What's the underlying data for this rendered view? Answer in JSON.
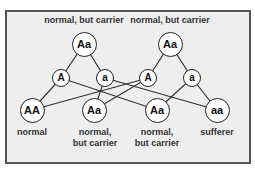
{
  "diagram": {
    "type": "genetic-cross",
    "parents": [
      {
        "id": "p1",
        "genotype": "Aa",
        "label": "normal, but carrier"
      },
      {
        "id": "p2",
        "genotype": "Aa",
        "label": "normal, but carrier"
      }
    ],
    "gametes": [
      {
        "id": "g1",
        "allele": "A",
        "parent": "p1"
      },
      {
        "id": "g2",
        "allele": "a",
        "parent": "p1"
      },
      {
        "id": "g3",
        "allele": "A",
        "parent": "p2"
      },
      {
        "id": "g4",
        "allele": "a",
        "parent": "p2"
      }
    ],
    "offspring": [
      {
        "id": "o1",
        "genotype": "AA",
        "label_line1": "normal",
        "label_line2": "",
        "from": [
          "g1",
          "g3"
        ]
      },
      {
        "id": "o2",
        "genotype": "Aa",
        "label_line1": "normal,",
        "label_line2": "but carrier",
        "from": [
          "g2",
          "g3"
        ]
      },
      {
        "id": "o3",
        "genotype": "Aa",
        "label_line1": "normal,",
        "label_line2": "but carrier",
        "from": [
          "g1",
          "g4"
        ]
      },
      {
        "id": "o4",
        "genotype": "aa",
        "label_line1": "sufferer",
        "label_line2": "",
        "from": [
          "g2",
          "g4"
        ]
      }
    ]
  },
  "colors": {
    "frame_background": "#eeeeee",
    "frame_border": "#555555",
    "node_fill": "#ffffff",
    "node_stroke": "#222222",
    "text": "#333333"
  }
}
